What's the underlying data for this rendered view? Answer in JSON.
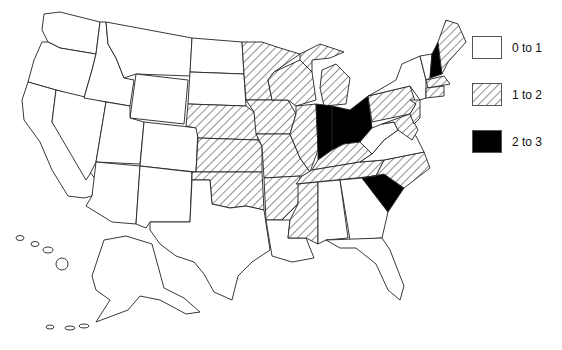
{
  "map": {
    "title": "",
    "region": "United States",
    "categories": [
      {
        "key": "low",
        "label": "0 to 1",
        "fill": "white"
      },
      {
        "key": "mid",
        "label": "1 to 2",
        "fill": "hatched"
      },
      {
        "key": "high",
        "label": "2 to 3",
        "fill": "black"
      }
    ],
    "states": {
      "high": [
        "Ohio",
        "Indiana",
        "South Carolina",
        "New Hampshire"
      ],
      "mid": [
        "Minnesota",
        "Wisconsin",
        "Michigan",
        "Iowa",
        "Illinois",
        "Missouri",
        "Nebraska",
        "Kansas",
        "Oklahoma",
        "Arkansas",
        "Mississippi",
        "Tennessee",
        "Kentucky",
        "North Carolina",
        "Pennsylvania",
        "New Jersey",
        "Delaware",
        "Maryland",
        "Maine",
        "Massachusetts",
        "Connecticut",
        "Rhode Island"
      ],
      "low": [
        "Washington",
        "Oregon",
        "California",
        "Nevada",
        "Idaho",
        "Montana",
        "Wyoming",
        "Utah",
        "Colorado",
        "Arizona",
        "New Mexico",
        "North Dakota",
        "South Dakota",
        "Texas",
        "Louisiana",
        "Alabama",
        "Georgia",
        "Florida",
        "Virginia",
        "West Virginia",
        "New York",
        "Vermont",
        "Alaska",
        "Hawaii"
      ]
    }
  },
  "legend": {
    "items": [
      {
        "label": "0 to 1"
      },
      {
        "label": "1 to 2"
      },
      {
        "label": "2 to 3"
      }
    ]
  },
  "colors": {
    "outline": "#222222",
    "high": "#000000",
    "background": "#ffffff"
  }
}
